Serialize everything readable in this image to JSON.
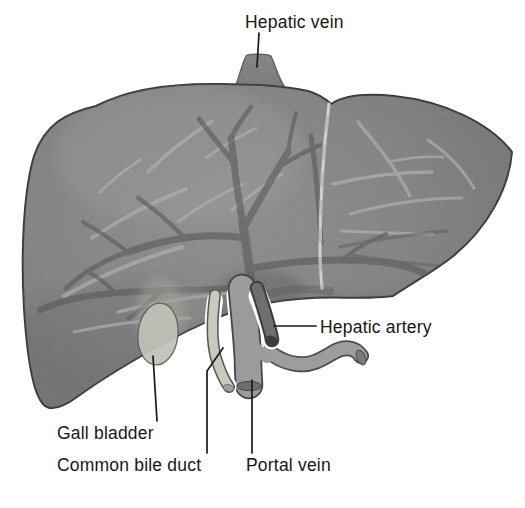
{
  "figure": {
    "labels": {
      "hepatic_vein": "Hepatic vein",
      "hepatic_artery": "Hepatic artery",
      "gall_bladder": "Gall bladder",
      "common_bile_duct": "Common bile duct",
      "portal_vein": "Portal vein"
    },
    "colors": {
      "background": "#ffffff",
      "liver_body": "#8d8d8d",
      "liver_edge_dark": "#6f6f6f",
      "outline": "#383838",
      "dark_vessels": "#585858",
      "light_vessels": "#c3c3c3",
      "falciform_ligament": "#e6e6e6",
      "hepatic_vein_stub": "#868686",
      "gall_bladder": "#bfc2b8",
      "common_bile_duct": "#c7cabf",
      "portal_vein": "#9b9b9b",
      "hepatic_artery": "#6f6f6f",
      "vessel_end_caps": "#3d3d3d",
      "label_text": "#161616"
    }
  }
}
